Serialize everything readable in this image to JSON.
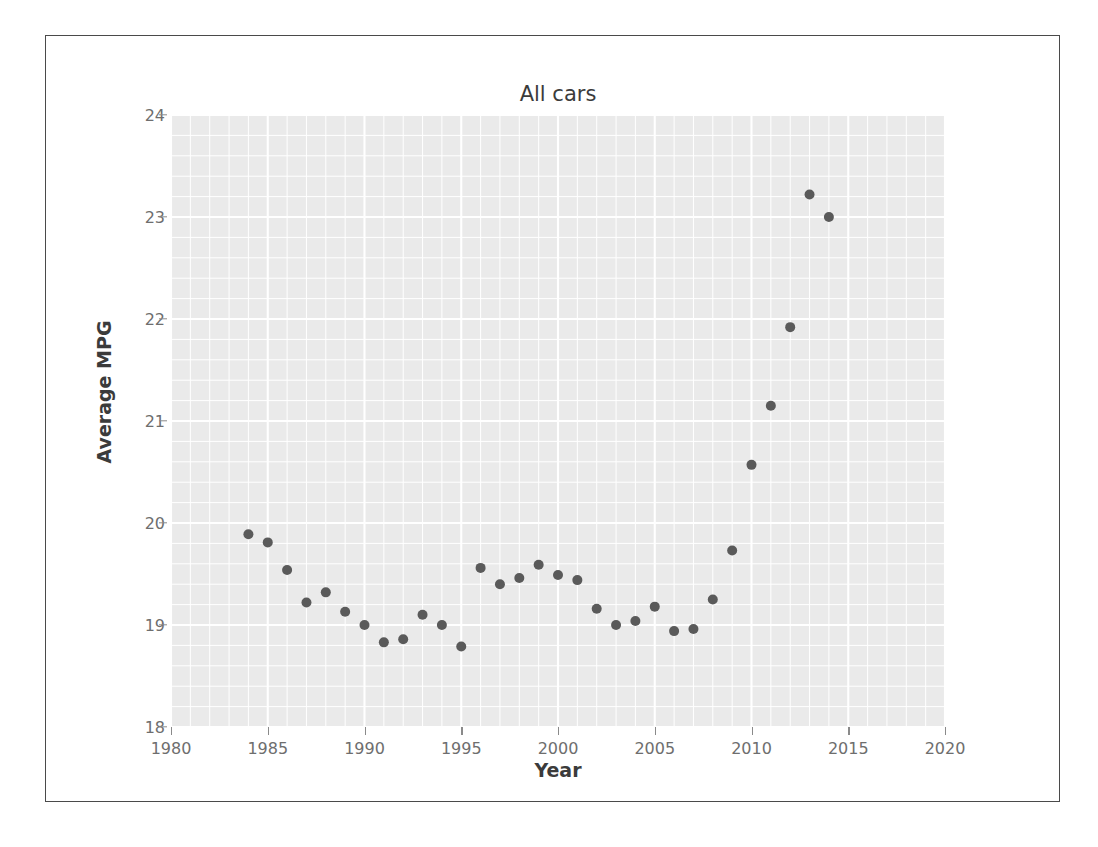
{
  "figure": {
    "title": "All cars",
    "xlabel": "Year",
    "ylabel": "Average MPG"
  },
  "chart_data": {
    "type": "scatter",
    "title": "All cars",
    "xlabel": "Year",
    "ylabel": "Average MPG",
    "xlim": [
      1980,
      2020
    ],
    "ylim": [
      18,
      24
    ],
    "xticks": [
      1980,
      1985,
      1990,
      1995,
      2000,
      2005,
      2010,
      2015,
      2020
    ],
    "ytick_labels": [
      "18",
      "19",
      "20",
      "21",
      "22",
      "23",
      "24"
    ],
    "yticks": [
      18,
      19,
      20,
      21,
      22,
      23,
      24
    ],
    "grid": true,
    "grid_major_color": "#ffffff",
    "grid_minor_color": "#ffffff",
    "plot_background": "#eaeaea",
    "marker_color": "#5a5a5a",
    "marker_size": 7,
    "legend": null,
    "x": [
      1984,
      1985,
      1986,
      1987,
      1988,
      1989,
      1990,
      1991,
      1992,
      1993,
      1994,
      1995,
      1996,
      1997,
      1998,
      1999,
      2000,
      2001,
      2002,
      2003,
      2004,
      2005,
      2006,
      2007,
      2008,
      2009,
      2010,
      2011,
      2012,
      2013,
      2014
    ],
    "y": [
      19.89,
      19.81,
      19.54,
      19.22,
      19.32,
      19.13,
      19.0,
      18.83,
      18.86,
      19.1,
      19.0,
      18.79,
      19.56,
      19.4,
      19.46,
      19.59,
      19.49,
      19.44,
      19.16,
      19.0,
      19.04,
      19.18,
      18.94,
      18.96,
      19.25,
      19.73,
      20.57,
      21.15,
      21.92,
      23.22,
      23.0
    ],
    "series": [
      {
        "name": "All cars",
        "points": [
          {
            "year": 1984,
            "mpg": 19.89
          },
          {
            "year": 1985,
            "mpg": 19.81
          },
          {
            "year": 1986,
            "mpg": 19.54
          },
          {
            "year": 1987,
            "mpg": 19.22
          },
          {
            "year": 1988,
            "mpg": 19.32
          },
          {
            "year": 1989,
            "mpg": 19.13
          },
          {
            "year": 1990,
            "mpg": 19.0
          },
          {
            "year": 1991,
            "mpg": 18.83
          },
          {
            "year": 1992,
            "mpg": 18.86
          },
          {
            "year": 1993,
            "mpg": 19.1
          },
          {
            "year": 1994,
            "mpg": 19.0
          },
          {
            "year": 1995,
            "mpg": 18.79
          },
          {
            "year": 1996,
            "mpg": 19.56
          },
          {
            "year": 1997,
            "mpg": 19.4
          },
          {
            "year": 1998,
            "mpg": 19.46
          },
          {
            "year": 1999,
            "mpg": 19.59
          },
          {
            "year": 2000,
            "mpg": 19.49
          },
          {
            "year": 2001,
            "mpg": 19.44
          },
          {
            "year": 2002,
            "mpg": 19.16
          },
          {
            "year": 2003,
            "mpg": 19.0
          },
          {
            "year": 2004,
            "mpg": 19.04
          },
          {
            "year": 2005,
            "mpg": 19.18
          },
          {
            "year": 2006,
            "mpg": 18.94
          },
          {
            "year": 2007,
            "mpg": 18.96
          },
          {
            "year": 2008,
            "mpg": 19.25
          },
          {
            "year": 2009,
            "mpg": 19.73
          },
          {
            "year": 2010,
            "mpg": 20.57
          },
          {
            "year": 2011,
            "mpg": 21.15
          },
          {
            "year": 2012,
            "mpg": 21.92
          },
          {
            "year": 2013,
            "mpg": 23.22
          },
          {
            "year": 2014,
            "mpg": 23.0
          }
        ]
      }
    ]
  }
}
